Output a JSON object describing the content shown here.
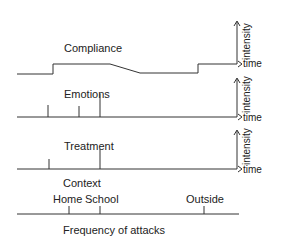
{
  "panels": [
    {
      "id": "compliance",
      "title": "Compliance",
      "x_axis": "time",
      "y_axis": "intensity"
    },
    {
      "id": "emotions",
      "title": "Emotions",
      "x_axis": "time",
      "y_axis": "intensity"
    },
    {
      "id": "treatment",
      "title": "Treatment",
      "x_axis": "time",
      "y_axis": "intensity"
    }
  ],
  "context": {
    "title": "Context",
    "markers": [
      {
        "label": "Home"
      },
      {
        "label": "School"
      },
      {
        "label": "Outside"
      }
    ],
    "axis_label": "Frequency of attacks"
  }
}
